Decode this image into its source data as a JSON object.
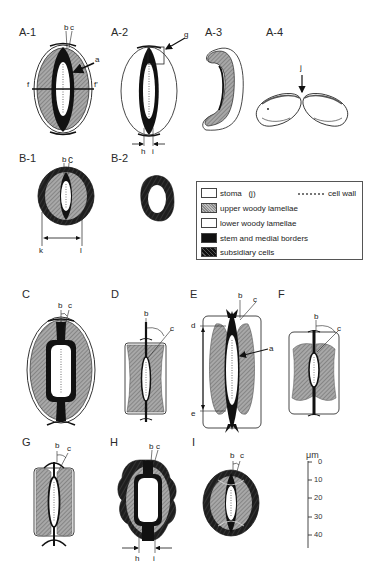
{
  "panels": {
    "a1": {
      "label": "A-1",
      "annotations": [
        "b",
        "c",
        "a",
        "f",
        "f'"
      ]
    },
    "a2": {
      "label": "A-2",
      "annotations": [
        "g",
        "h",
        "i"
      ]
    },
    "a3": {
      "label": "A-3"
    },
    "a4": {
      "label": "A-4",
      "annotations": [
        "j"
      ]
    },
    "b1": {
      "label": "B-1",
      "annotations": [
        "b",
        "c",
        "k",
        "l"
      ]
    },
    "b2": {
      "label": "B-2"
    },
    "c": {
      "label": "C",
      "annotations": [
        "b",
        "c"
      ]
    },
    "d": {
      "label": "D",
      "annotations": [
        "b",
        "c"
      ]
    },
    "e": {
      "label": "E",
      "annotations": [
        "b",
        "c",
        "d",
        "a",
        "e"
      ]
    },
    "f": {
      "label": "F",
      "annotations": [
        "b",
        "c"
      ]
    },
    "g": {
      "label": "G",
      "annotations": [
        "b",
        "c"
      ]
    },
    "h": {
      "label": "H",
      "annotations": [
        "b",
        "c",
        "h",
        "i"
      ]
    },
    "i": {
      "label": "I",
      "annotations": [
        "b",
        "c"
      ]
    }
  },
  "labels": {
    "a": "a",
    "b": "b",
    "c": "c",
    "d": "d",
    "e": "e",
    "f": "f",
    "f_prime": "f'",
    "g": "g",
    "h": "h",
    "i": "i",
    "j": "j",
    "k": "k",
    "l": "l"
  },
  "legend": {
    "items": [
      {
        "key": "stoma",
        "label": "stoma   (j)"
      },
      {
        "key": "upper",
        "label": "upper woody lamellae"
      },
      {
        "key": "lower",
        "label": "lower woody lamellae"
      },
      {
        "key": "stem",
        "label": "stem and medial borders"
      },
      {
        "key": "subsidiary",
        "label": "subsidiary cells"
      }
    ],
    "cell_wall": "cell wall"
  },
  "scale_bar": {
    "unit": "μm",
    "ticks": [
      "0",
      "10",
      "20",
      "30",
      "40"
    ]
  },
  "colors": {
    "stem": "#111111",
    "upper_lamellae": "#9a9a9a",
    "outline": "#333333",
    "background": "#ffffff"
  }
}
